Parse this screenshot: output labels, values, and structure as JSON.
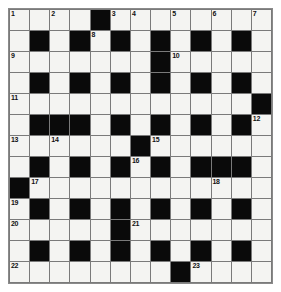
{
  "puzzle": {
    "type": "crossword-grid",
    "title": "",
    "columns": 13,
    "rows": 13,
    "colors": {
      "block": "#0a0a0a",
      "open": "#f4f4f2",
      "gridline": "#7a7a7a",
      "number": "#111111",
      "page_background": "#ffffff"
    },
    "numbered_cells": [
      {
        "number": "1",
        "row": 1,
        "col": 1
      },
      {
        "number": "2",
        "row": 1,
        "col": 3
      },
      {
        "number": "3",
        "row": 1,
        "col": 6
      },
      {
        "number": "4",
        "row": 1,
        "col": 7
      },
      {
        "number": "5",
        "row": 1,
        "col": 9
      },
      {
        "number": "6",
        "row": 1,
        "col": 11
      },
      {
        "number": "7",
        "row": 1,
        "col": 13
      },
      {
        "number": "8",
        "row": 2,
        "col": 5
      },
      {
        "number": "9",
        "row": 3,
        "col": 1
      },
      {
        "number": "10",
        "row": 3,
        "col": 9
      },
      {
        "number": "11",
        "row": 5,
        "col": 1
      },
      {
        "number": "12",
        "row": 6,
        "col": 13
      },
      {
        "number": "13",
        "row": 7,
        "col": 1
      },
      {
        "number": "14",
        "row": 7,
        "col": 3
      },
      {
        "number": "15",
        "row": 7,
        "col": 8
      },
      {
        "number": "16",
        "row": 8,
        "col": 7
      },
      {
        "number": "17",
        "row": 9,
        "col": 2
      },
      {
        "number": "18",
        "row": 9,
        "col": 11
      },
      {
        "number": "19",
        "row": 10,
        "col": 1
      },
      {
        "number": "20",
        "row": 11,
        "col": 1
      },
      {
        "number": "21",
        "row": 11,
        "col": 7
      },
      {
        "number": "22",
        "row": 13,
        "col": 1
      },
      {
        "number": "23",
        "row": 13,
        "col": 10
      }
    ],
    "grid": [
      [
        "open",
        "open",
        "open",
        "open",
        "block",
        "open",
        "open",
        "open",
        "open",
        "open",
        "open",
        "open",
        "open"
      ],
      [
        "open",
        "block",
        "open",
        "block",
        "open",
        "block",
        "open",
        "block",
        "open",
        "block",
        "open",
        "block",
        "open"
      ],
      [
        "open",
        "open",
        "open",
        "open",
        "open",
        "open",
        "open",
        "block",
        "open",
        "open",
        "open",
        "open",
        "open"
      ],
      [
        "open",
        "block",
        "open",
        "block",
        "open",
        "block",
        "open",
        "block",
        "open",
        "block",
        "open",
        "block",
        "open"
      ],
      [
        "open",
        "open",
        "open",
        "open",
        "open",
        "open",
        "open",
        "open",
        "open",
        "open",
        "open",
        "open",
        "block"
      ],
      [
        "open",
        "block",
        "block",
        "block",
        "open",
        "block",
        "open",
        "block",
        "open",
        "block",
        "open",
        "block",
        "open"
      ],
      [
        "open",
        "open",
        "open",
        "open",
        "open",
        "open",
        "block",
        "open",
        "open",
        "open",
        "open",
        "open",
        "open"
      ],
      [
        "open",
        "block",
        "open",
        "block",
        "open",
        "block",
        "open",
        "block",
        "open",
        "block",
        "block",
        "block",
        "open"
      ],
      [
        "block",
        "open",
        "open",
        "open",
        "open",
        "open",
        "open",
        "open",
        "open",
        "open",
        "open",
        "open",
        "open"
      ],
      [
        "open",
        "block",
        "open",
        "block",
        "open",
        "block",
        "open",
        "block",
        "open",
        "block",
        "open",
        "block",
        "open"
      ],
      [
        "open",
        "open",
        "open",
        "open",
        "open",
        "block",
        "open",
        "open",
        "open",
        "open",
        "open",
        "open",
        "open"
      ],
      [
        "open",
        "block",
        "open",
        "block",
        "open",
        "block",
        "open",
        "block",
        "open",
        "block",
        "open",
        "block",
        "open"
      ],
      [
        "open",
        "open",
        "open",
        "open",
        "open",
        "open",
        "open",
        "open",
        "block",
        "open",
        "open",
        "open",
        "open"
      ]
    ],
    "letters": []
  }
}
